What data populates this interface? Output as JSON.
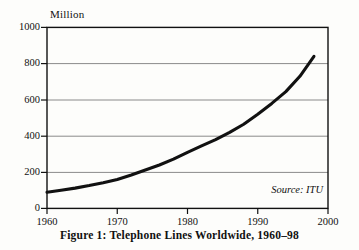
{
  "chart_data": {
    "type": "line",
    "title": "Figure 1: Telephone Lines Worldwide, 1960–98",
    "xlabel": "",
    "ylabel": "Million",
    "unit_label": "Million",
    "xlim": [
      1960,
      2000
    ],
    "ylim": [
      0,
      1000
    ],
    "grid": "horizontal",
    "legend": "none",
    "annotation": "Source: ITU",
    "xticks": [
      1960,
      1970,
      1980,
      1990,
      2000
    ],
    "xtick_labels": [
      "1960",
      "1970",
      "1980",
      "1990",
      "2000"
    ],
    "yticks": [
      0,
      200,
      400,
      600,
      800,
      1000
    ],
    "ytick_labels": [
      "0",
      "200",
      "400",
      "600",
      "800",
      "1000"
    ],
    "series": [
      {
        "name": "Telephone lines worldwide",
        "color": "#111111",
        "x": [
          1960,
          1962,
          1964,
          1966,
          1968,
          1970,
          1972,
          1974,
          1976,
          1978,
          1980,
          1982,
          1984,
          1986,
          1988,
          1990,
          1992,
          1994,
          1996,
          1998
        ],
        "values": [
          89,
          100,
          112,
          126,
          142,
          160,
          185,
          212,
          240,
          272,
          310,
          345,
          380,
          420,
          465,
          520,
          580,
          645,
          730,
          840
        ]
      }
    ]
  },
  "figure": {
    "caption": "Figure 1: Telephone Lines Worldwide, 1960–98",
    "source": "Source: ITU",
    "y_axis_unit": "Million"
  },
  "colors": {
    "background": "#fdfdfb",
    "axis": "#111111",
    "gridline": "#8a8a8a",
    "curve": "#111111",
    "text": "#111111"
  }
}
